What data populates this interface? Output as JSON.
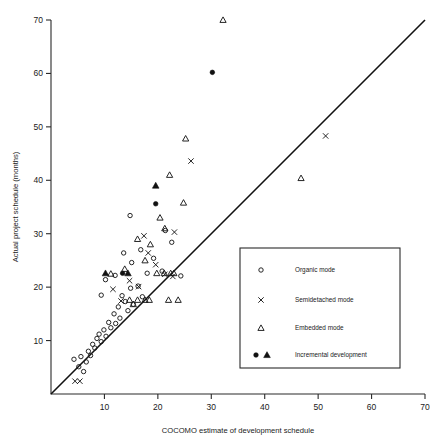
{
  "chart_data": {
    "type": "scatter",
    "title": "",
    "xlabel": "COCOMO estimate of development schedule",
    "ylabel": "Actual project schedule (months)",
    "xlim": [
      0,
      70
    ],
    "ylim": [
      0,
      70
    ],
    "xticks": [
      10,
      20,
      30,
      40,
      50,
      60,
      70
    ],
    "yticks": [
      10,
      20,
      30,
      40,
      50,
      60,
      70
    ],
    "grid": false,
    "annotations": [
      {
        "type": "reference-line",
        "label": "y = x",
        "from": [
          0,
          0
        ],
        "to": [
          70,
          70
        ]
      }
    ],
    "legend": {
      "position": "lower-right",
      "entries": [
        {
          "marker": "open-circle",
          "label": "Organic mode"
        },
        {
          "marker": "cross",
          "label": "Semidetached mode"
        },
        {
          "marker": "open-triangle",
          "label": "Embedded mode"
        },
        {
          "marker": "filled-circle-and-filled-triangle",
          "label": "Incremental development"
        }
      ]
    },
    "series": [
      {
        "name": "Organic mode",
        "marker": "open-circle",
        "points": [
          [
            4.3,
            6.5
          ],
          [
            5.2,
            5.1
          ],
          [
            5.6,
            7.0
          ],
          [
            6.1,
            4.2
          ],
          [
            6.6,
            6.0
          ],
          [
            7.0,
            8.0
          ],
          [
            7.4,
            7.2
          ],
          [
            7.8,
            9.3
          ],
          [
            8.2,
            8.6
          ],
          [
            8.6,
            10.4
          ],
          [
            9.0,
            11.2
          ],
          [
            9.4,
            9.8
          ],
          [
            9.9,
            12.0
          ],
          [
            10.3,
            10.8
          ],
          [
            10.8,
            13.4
          ],
          [
            11.2,
            12.4
          ],
          [
            11.8,
            15.0
          ],
          [
            12.1,
            13.2
          ],
          [
            12.6,
            16.3
          ],
          [
            12.9,
            14.2
          ],
          [
            13.3,
            18.4
          ],
          [
            13.9,
            17.3
          ],
          [
            14.4,
            15.6
          ],
          [
            14.9,
            19.8
          ],
          [
            15.4,
            16.8
          ],
          [
            9.4,
            18.5
          ],
          [
            10.2,
            21.4
          ],
          [
            12.0,
            22.2
          ],
          [
            13.6,
            26.4
          ],
          [
            15.1,
            24.6
          ],
          [
            16.3,
            20.2
          ],
          [
            17.1,
            18.2
          ],
          [
            18.0,
            22.6
          ],
          [
            19.2,
            25.4
          ],
          [
            20.8,
            23.0
          ],
          [
            14.8,
            33.4
          ],
          [
            21.4,
            30.6
          ],
          [
            22.6,
            28.4
          ],
          [
            24.3,
            22.1
          ],
          [
            16.8,
            27.0
          ]
        ]
      },
      {
        "name": "Semidetached mode",
        "marker": "cross",
        "points": [
          [
            4.5,
            2.4
          ],
          [
            5.4,
            2.4
          ],
          [
            11.6,
            19.6
          ],
          [
            13.1,
            17.4
          ],
          [
            14.7,
            21.2
          ],
          [
            16.4,
            20.1
          ],
          [
            18.2,
            26.4
          ],
          [
            19.6,
            24.2
          ],
          [
            21.3,
            22.4
          ],
          [
            17.4,
            29.6
          ],
          [
            22.8,
            22.0
          ],
          [
            23.1,
            30.3
          ],
          [
            26.2,
            43.6
          ],
          [
            51.4,
            48.3
          ]
        ]
      },
      {
        "name": "Embedded mode",
        "marker": "open-triangle",
        "points": [
          [
            11.2,
            22.5
          ],
          [
            13.8,
            23.4
          ],
          [
            14.7,
            17.6
          ],
          [
            15.4,
            16.8
          ],
          [
            16.2,
            17.6
          ],
          [
            17.6,
            17.6
          ],
          [
            18.4,
            17.6
          ],
          [
            19.8,
            22.6
          ],
          [
            21.2,
            22.6
          ],
          [
            22.4,
            22.6
          ],
          [
            23.0,
            22.6
          ],
          [
            22.0,
            17.6
          ],
          [
            23.8,
            17.6
          ],
          [
            16.2,
            29.0
          ],
          [
            18.6,
            28.0
          ],
          [
            20.4,
            33.0
          ],
          [
            21.3,
            31.0
          ],
          [
            17.6,
            25.0
          ],
          [
            24.8,
            35.8
          ],
          [
            22.2,
            41.0
          ],
          [
            25.2,
            47.8
          ],
          [
            32.2,
            70.0
          ],
          [
            46.8,
            40.4
          ]
        ]
      },
      {
        "name": "Incremental development",
        "marker": "filled",
        "points": [
          [
            10.2,
            22.6
          ],
          [
            13.4,
            22.6
          ],
          [
            14.4,
            22.6
          ],
          [
            19.6,
            35.6
          ],
          [
            19.6,
            39.0
          ],
          [
            30.2,
            60.2
          ]
        ]
      }
    ]
  },
  "axes": {
    "x_title": "COCOMO estimate of development schedule",
    "y_title": "Actual project schedule (months)",
    "x_tick_labels": [
      "10",
      "20",
      "30",
      "40",
      "50",
      "60",
      "70"
    ],
    "y_tick_labels": [
      "10",
      "20",
      "30",
      "40",
      "50",
      "60",
      "70"
    ]
  },
  "legend": {
    "items": [
      {
        "label": "Organic mode"
      },
      {
        "label": "Semidetached mode"
      },
      {
        "label": "Embedded mode"
      },
      {
        "label": "Incremental development"
      }
    ]
  },
  "colors": {
    "ink": "#1a1a1a",
    "axis": "#2b2b2b",
    "line": "#111111",
    "background": "#ffffff"
  }
}
